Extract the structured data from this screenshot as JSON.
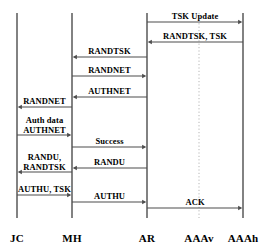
{
  "diagram": {
    "type": "uml-sequence-diagram",
    "width": 277,
    "height": 246,
    "background": "#ffffff",
    "line_color": "#4d4d4d",
    "dotted_color": "#b5b5b5",
    "text_color": "#000000",
    "lifelines": [
      {
        "id": "jc",
        "label": "JC",
        "x": 17,
        "top": 13,
        "bottom": 218,
        "style": "solid"
      },
      {
        "id": "mh",
        "label": "MH",
        "x": 72,
        "top": 13,
        "bottom": 218,
        "style": "solid"
      },
      {
        "id": "ar",
        "label": "AR",
        "x": 147,
        "top": 13,
        "bottom": 218,
        "style": "solid"
      },
      {
        "id": "aaav",
        "label": "AAAv",
        "x": 199,
        "top": 13,
        "bottom": 218,
        "style": "dotted"
      },
      {
        "id": "aaah",
        "label": "AAAh",
        "x": 243,
        "top": 13,
        "bottom": 218,
        "style": "solid"
      }
    ],
    "label_row_y": 232,
    "messages": [
      {
        "id": "m1",
        "label": "TSK Update",
        "from": "ar",
        "to": "aaah",
        "y": 22,
        "direction": "right"
      },
      {
        "id": "m2",
        "label": "RANDTSK, TSK",
        "from": "aaah",
        "to": "ar",
        "y": 42,
        "direction": "left"
      },
      {
        "id": "m3",
        "label": "RANDTSK",
        "from": "ar",
        "to": "mh",
        "y": 57,
        "direction": "left"
      },
      {
        "id": "m4",
        "label": "RANDNET",
        "from": "mh",
        "to": "ar",
        "y": 76,
        "direction": "right"
      },
      {
        "id": "m5",
        "label": "AUTHNET",
        "from": "ar",
        "to": "mh",
        "y": 97,
        "direction": "left"
      },
      {
        "id": "m6",
        "label": "RANDNET",
        "from": "mh",
        "to": "jc",
        "y": 107,
        "direction": "left"
      },
      {
        "id": "m7",
        "label": "Auth data",
        "label2": "AUTHNET",
        "from": "jc",
        "to": "mh",
        "y": 135,
        "direction": "right"
      },
      {
        "id": "m8",
        "label": "Success",
        "from": "mh",
        "to": "ar",
        "y": 147,
        "direction": "right"
      },
      {
        "id": "m9",
        "label": "RANDU",
        "from": "ar",
        "to": "mh",
        "y": 168,
        "direction": "left"
      },
      {
        "id": "m10",
        "label": "RANDU,",
        "label2": "RANDTSK",
        "from": "mh",
        "to": "jc",
        "y": 172,
        "direction": "left"
      },
      {
        "id": "m11",
        "label": "AUTHU, TSK",
        "from": "jc",
        "to": "mh",
        "y": 195,
        "direction": "right"
      },
      {
        "id": "m12",
        "label": "AUTHU",
        "from": "mh",
        "to": "ar",
        "y": 202,
        "direction": "right"
      },
      {
        "id": "m13",
        "label": "ACK",
        "from": "ar",
        "to": "aaah",
        "y": 208,
        "direction": "right"
      }
    ]
  }
}
